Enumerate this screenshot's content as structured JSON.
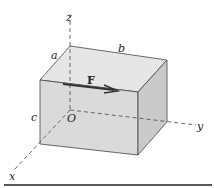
{
  "figure": {
    "axes": {
      "x": "x",
      "y": "y",
      "z": "z",
      "origin": "O"
    },
    "dimensions": {
      "a": "a",
      "b": "b",
      "c": "c"
    },
    "force": {
      "label": "F"
    },
    "colors": {
      "top_face": "#e6e6e6",
      "front_face": "#d9d9d9",
      "side_face": "#c8c8c8",
      "edge": "#444444",
      "arrow": "#333333"
    }
  }
}
